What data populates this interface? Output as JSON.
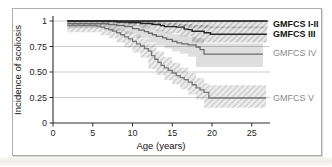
{
  "style": {
    "panel_border_color": "#aeaeae",
    "background": "#ffffff",
    "grid_color": "#c2c2c2",
    "axis_color": "#2e2e2e",
    "tick_text_color": "#1f1f1f"
  },
  "chart_data": {
    "type": "line",
    "subtype": "kaplan-meier-step-with-confidence-bands",
    "title": "",
    "xlabel": "Age (years)",
    "ylabel": "Incidence of scoliosis",
    "xlim": [
      0,
      27.5
    ],
    "ylim": [
      0,
      1
    ],
    "grid": "horizontal",
    "legend_position": "inline-right-margin",
    "xticks": [
      {
        "label": "0",
        "value": 0
      },
      {
        "label": "5",
        "value": 5
      },
      {
        "label": "10",
        "value": 10
      },
      {
        "label": "15",
        "value": 15
      },
      {
        "label": "20",
        "value": 20
      },
      {
        "label": "25",
        "value": 25
      }
    ],
    "yticks": [
      {
        "label": "1",
        "value": 1
      },
      {
        "label": "0.75",
        "value": 0.75
      },
      {
        "label": "0.50",
        "value": 0.5
      },
      {
        "label": "0.25",
        "value": 0.25
      },
      {
        "label": "0",
        "value": 0
      }
    ],
    "series": [
      {
        "name": "GMFCS I-II",
        "label_value": 0.97,
        "bold_label": true,
        "label_color": "#111111",
        "line_color": "#0f0f0f",
        "line_width": 1.7,
        "band_style": "hatch",
        "band_bg": "#00000017",
        "band_line": "#00000030",
        "points": [
          [
            1.8,
            1.0
          ],
          [
            27.0,
            1.0
          ]
        ],
        "band": [
          [
            1.8,
            1.0,
            1.0
          ],
          [
            6,
            0.99,
            1.0
          ],
          [
            9,
            0.98,
            1.0
          ],
          [
            12,
            0.97,
            1.0
          ],
          [
            14,
            0.96,
            1.0
          ],
          [
            16,
            0.95,
            1.0
          ],
          [
            17,
            0.94,
            1.0
          ],
          [
            19,
            0.93,
            1.0
          ],
          [
            27.0,
            0.93,
            1.0
          ]
        ]
      },
      {
        "name": "GMFCS III",
        "label_value": 0.87,
        "bold_label": true,
        "label_color": "#111111",
        "line_color": "#262626",
        "line_width": 1.4,
        "band_style": "hatch",
        "band_bg": "#00000017",
        "band_line": "#00000030",
        "points": [
          [
            1.8,
            1.0
          ],
          [
            7.5,
            1.0
          ],
          [
            8,
            0.99
          ],
          [
            9.5,
            0.985
          ],
          [
            11,
            0.975
          ],
          [
            12.5,
            0.965
          ],
          [
            13.5,
            0.955
          ],
          [
            14,
            0.945
          ],
          [
            15.5,
            0.94
          ],
          [
            16.5,
            0.92
          ],
          [
            17,
            0.915
          ],
          [
            17.5,
            0.9
          ],
          [
            19,
            0.885
          ],
          [
            19.8,
            0.87
          ],
          [
            26.9,
            0.87
          ]
        ],
        "band": [
          [
            1.8,
            0.99,
            1.0
          ],
          [
            8,
            0.96,
            1.0
          ],
          [
            11,
            0.95,
            1.0
          ],
          [
            13,
            0.93,
            0.99
          ],
          [
            14,
            0.9,
            0.98
          ],
          [
            16,
            0.88,
            0.97
          ],
          [
            17.5,
            0.85,
            0.96
          ],
          [
            19.8,
            0.79,
            0.945
          ],
          [
            26.9,
            0.79,
            0.945
          ]
        ]
      },
      {
        "name": "GMFCS IV",
        "label_value": 0.69,
        "bold_label": false,
        "label_color": "#8a8a8a",
        "line_color": "#6b6b6b",
        "line_width": 1.3,
        "band_style": "solid",
        "band_bg": "#00000021",
        "band_line": "#00000021",
        "points": [
          [
            1.8,
            0.975
          ],
          [
            6.5,
            0.975
          ],
          [
            7,
            0.965
          ],
          [
            8,
            0.955
          ],
          [
            9,
            0.945
          ],
          [
            10,
            0.925
          ],
          [
            10.8,
            0.91
          ],
          [
            11.5,
            0.895
          ],
          [
            12,
            0.88
          ],
          [
            12.5,
            0.865
          ],
          [
            13,
            0.85
          ],
          [
            13.8,
            0.835
          ],
          [
            14.3,
            0.82
          ],
          [
            15,
            0.8
          ],
          [
            15.6,
            0.785
          ],
          [
            16.2,
            0.775
          ],
          [
            17,
            0.765
          ],
          [
            18,
            0.745
          ],
          [
            18.5,
            0.72
          ],
          [
            19,
            0.675
          ],
          [
            26.4,
            0.675
          ]
        ],
        "band": [
          [
            1.8,
            0.94,
            1.0
          ],
          [
            7,
            0.93,
            0.995
          ],
          [
            9,
            0.9,
            0.98
          ],
          [
            10.5,
            0.87,
            0.96
          ],
          [
            12,
            0.83,
            0.935
          ],
          [
            13,
            0.79,
            0.91
          ],
          [
            14,
            0.76,
            0.885
          ],
          [
            15,
            0.73,
            0.87
          ],
          [
            16,
            0.7,
            0.855
          ],
          [
            17,
            0.68,
            0.845
          ],
          [
            18,
            0.65,
            0.83
          ],
          [
            19,
            0.55,
            0.78
          ],
          [
            26.4,
            0.55,
            0.78
          ]
        ]
      },
      {
        "name": "GMFCS V",
        "label_value": 0.25,
        "bold_label": false,
        "label_color": "#8a8a8a",
        "line_color": "#787878",
        "line_width": 1.3,
        "band_style": "hatch",
        "band_bg": "#00000012",
        "band_line": "#00000026",
        "points": [
          [
            1.8,
            0.955
          ],
          [
            5,
            0.955
          ],
          [
            5.5,
            0.95
          ],
          [
            6,
            0.94
          ],
          [
            6.5,
            0.925
          ],
          [
            7,
            0.915
          ],
          [
            7.5,
            0.9
          ],
          [
            8,
            0.885
          ],
          [
            8.5,
            0.865
          ],
          [
            9,
            0.845
          ],
          [
            9.5,
            0.825
          ],
          [
            10,
            0.8
          ],
          [
            10.5,
            0.775
          ],
          [
            11,
            0.755
          ],
          [
            11.5,
            0.73
          ],
          [
            12,
            0.705
          ],
          [
            12.4,
            0.66
          ],
          [
            12.8,
            0.625
          ],
          [
            13.2,
            0.595
          ],
          [
            13.6,
            0.565
          ],
          [
            14,
            0.54
          ],
          [
            14.5,
            0.515
          ],
          [
            15,
            0.49
          ],
          [
            15.5,
            0.465
          ],
          [
            16,
            0.445
          ],
          [
            16.5,
            0.425
          ],
          [
            17,
            0.4
          ],
          [
            17.5,
            0.375
          ],
          [
            18,
            0.345
          ],
          [
            18.5,
            0.325
          ],
          [
            19,
            0.3
          ],
          [
            19.6,
            0.245
          ],
          [
            26.8,
            0.245
          ]
        ],
        "band": [
          [
            1.8,
            0.91,
            0.985
          ],
          [
            6,
            0.89,
            0.975
          ],
          [
            7,
            0.86,
            0.955
          ],
          [
            8,
            0.83,
            0.935
          ],
          [
            9,
            0.79,
            0.9
          ],
          [
            10,
            0.74,
            0.865
          ],
          [
            11,
            0.69,
            0.825
          ],
          [
            12,
            0.64,
            0.78
          ],
          [
            13,
            0.53,
            0.7
          ],
          [
            14,
            0.47,
            0.645
          ],
          [
            15,
            0.42,
            0.59
          ],
          [
            16,
            0.38,
            0.545
          ],
          [
            17,
            0.33,
            0.49
          ],
          [
            18,
            0.28,
            0.44
          ],
          [
            19,
            0.23,
            0.39
          ],
          [
            19.6,
            0.15,
            0.37
          ],
          [
            26.8,
            0.15,
            0.37
          ]
        ]
      }
    ]
  }
}
